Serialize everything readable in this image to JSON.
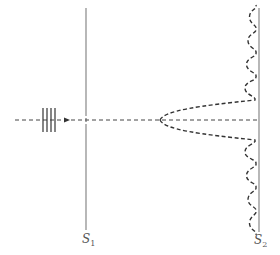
{
  "diagram": {
    "screens": [
      {
        "id": "s1",
        "label": "S",
        "subscript": "1",
        "role": "slit screen"
      },
      {
        "id": "s2",
        "label": "S",
        "subscript": "2",
        "role": "observation screen"
      }
    ],
    "incident_wave": {
      "wavefront_count": 4,
      "direction": "right"
    },
    "pattern": {
      "type": "diffraction intensity",
      "side_fringes_each_side": 4
    },
    "colors": {
      "line": "#777777",
      "curve": "#333333",
      "axis": "#444444",
      "text": "#555555"
    }
  }
}
